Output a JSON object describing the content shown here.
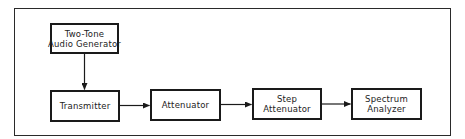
{
  "diagram": {
    "type": "block-diagram",
    "blocks": [
      {
        "id": "generator",
        "lines": [
          "Two-Tone",
          "Audio Generator"
        ]
      },
      {
        "id": "transmitter",
        "lines": [
          "Transmitter"
        ]
      },
      {
        "id": "attenuator",
        "lines": [
          "Attenuator"
        ]
      },
      {
        "id": "step_attenuator",
        "lines": [
          "Step",
          "Attenuator"
        ]
      },
      {
        "id": "spectrum_analyzer",
        "lines": [
          "Spectrum",
          "Analyzer"
        ]
      }
    ],
    "connections": [
      {
        "from": "generator",
        "to": "transmitter",
        "direction": "down"
      },
      {
        "from": "transmitter",
        "to": "attenuator",
        "direction": "right"
      },
      {
        "from": "attenuator",
        "to": "step_attenuator",
        "direction": "right"
      },
      {
        "from": "step_attenuator",
        "to": "spectrum_analyzer",
        "direction": "right"
      }
    ],
    "colors": {
      "line": "#1a1a1a",
      "background": "#ffffff"
    }
  }
}
